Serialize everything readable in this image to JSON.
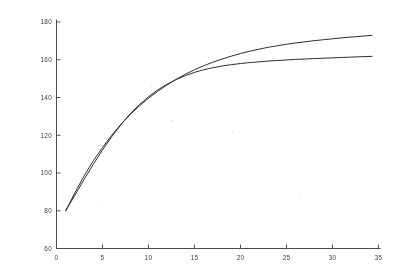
{
  "figure": {
    "background_color": "#ffffff",
    "ink_color": "#2e2e2e",
    "axis_color": "#4a4a4a",
    "render_style": "scanned-grayscale-lineplot",
    "width_px": 402,
    "height_px": 275
  },
  "axes": {
    "x_ticks": [
      "0",
      "5",
      "10",
      "15",
      "20",
      "25",
      "30",
      "35"
    ],
    "y_ticks": [
      "60",
      "80",
      "100",
      "120",
      "140",
      "160",
      "180"
    ]
  },
  "chart_data": {
    "type": "line",
    "title": "",
    "subtitle": "",
    "xlabel": "",
    "ylabel": "",
    "xlim": [
      0,
      35
    ],
    "ylim": [
      60,
      180
    ],
    "xticks": [
      0,
      5,
      10,
      15,
      20,
      25,
      30,
      35
    ],
    "yticks": [
      60,
      80,
      100,
      120,
      140,
      160,
      180
    ],
    "grid": false,
    "legend": false,
    "legend_position": "none",
    "annotations": [],
    "series": [
      {
        "name": "upper-curve",
        "color": "#2e2e2e",
        "x": [
          1.0,
          2.0,
          3.0,
          4.0,
          5.0,
          6.0,
          7.0,
          8.0,
          9.0,
          10.0,
          11.0,
          12.0,
          13.0,
          14.0,
          15.0,
          16.0,
          17.0,
          18.0,
          19.0,
          20.0,
          21.0,
          22.0,
          23.0,
          24.0,
          25.0,
          26.0,
          27.0,
          28.0,
          29.0,
          30.0,
          31.0,
          32.0,
          33.0,
          34.3
        ],
        "y": [
          80.0,
          89.5,
          98.5,
          106.5,
          113.5,
          120.0,
          125.8,
          131.0,
          135.5,
          139.6,
          143.3,
          146.6,
          149.6,
          152.3,
          154.7,
          156.8,
          158.7,
          160.4,
          161.9,
          163.3,
          164.5,
          165.6,
          166.6,
          167.4,
          168.2,
          168.9,
          169.5,
          170.1,
          170.6,
          171.1,
          171.6,
          172.0,
          172.4,
          172.9
        ]
      },
      {
        "name": "lower-curve",
        "color": "#2e2e2e",
        "x": [
          1.0,
          2.0,
          3.0,
          4.0,
          5.0,
          6.0,
          7.0,
          8.0,
          9.0,
          10.0,
          11.0,
          12.0,
          13.0,
          14.0,
          15.0,
          16.0,
          17.0,
          18.0,
          19.0,
          20.0,
          21.0,
          22.0,
          23.0,
          24.0,
          25.0,
          26.0,
          27.0,
          28.0,
          29.0,
          30.0,
          31.0,
          32.0,
          33.0,
          34.3
        ],
        "y": [
          80.0,
          88.2,
          96.6,
          104.6,
          112.2,
          119.2,
          125.6,
          131.3,
          136.2,
          140.4,
          144.0,
          147.0,
          149.5,
          151.6,
          153.3,
          154.7,
          155.8,
          156.7,
          157.4,
          158.0,
          158.5,
          158.9,
          159.3,
          159.6,
          159.9,
          160.2,
          160.4,
          160.6,
          160.8,
          161.0,
          161.2,
          161.4,
          161.6,
          161.8
        ]
      }
    ]
  }
}
